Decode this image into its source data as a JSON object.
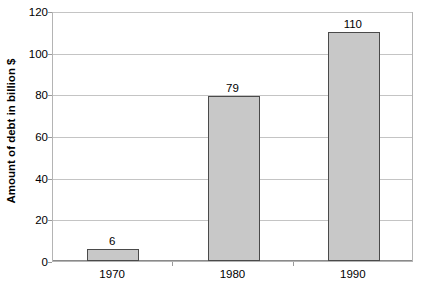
{
  "chart_data": {
    "type": "bar",
    "title": "",
    "xlabel": "",
    "ylabel": "Amount of debt in billion $",
    "categories": [
      "1970",
      "1980",
      "1990"
    ],
    "values": [
      6,
      79,
      110
    ],
    "value_labels": [
      "6",
      "79",
      "110"
    ],
    "ylim": [
      0,
      120
    ],
    "ytick_labels": [
      "0",
      "20",
      "40",
      "60",
      "80",
      "100",
      "120"
    ],
    "ytick_values": [
      0,
      20,
      40,
      60,
      80,
      100,
      120
    ],
    "grid": "horizontal",
    "legend": "none",
    "series": [
      {
        "name": "Amount of debt in billion $",
        "values": [
          6,
          79,
          110
        ]
      }
    ],
    "colors": {
      "bar_fill": "#c8c8c8",
      "bar_border": "#4a4a4a",
      "gridline": "#c4c4c4",
      "plot_border": "#b4b4b4",
      "axis": "#8a8a8a",
      "text": "#000000",
      "background": "#ffffff"
    }
  }
}
